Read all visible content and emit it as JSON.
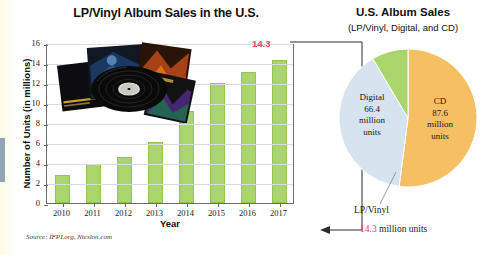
{
  "figure": {
    "source_note": "Source: IFPI.org, Nieslon.com"
  },
  "bar_chart": {
    "title": "LP/Vinyl Album Sales in the U.S.",
    "ylabel": "Number of Units (in millions)",
    "xlabel": "Year",
    "peak_label": "14.3"
  },
  "pie_chart": {
    "title": "U.S. Album Sales",
    "subtitle": "(LP/Vinyl, Digital, and CD)",
    "digital_label": "Digital",
    "digital_value": "66.4",
    "digital_unit1": "million",
    "digital_unit2": "units",
    "cd_label": "CD",
    "cd_value": "87.6",
    "cd_unit1": "million",
    "cd_unit2": "units",
    "lpvinyl_label": "LP/Vinyl",
    "lpvinyl_value": "14.3",
    "lpvinyl_value_suffix": " million units"
  },
  "colors": {
    "bar_green": "#a9d56c",
    "pie_digital": "#d6e4f0",
    "pie_cd": "#f5bf63",
    "pie_lpvinyl": "#a9d56c",
    "accent_red": "#d9475c"
  },
  "chart_data": [
    {
      "type": "bar",
      "title": "LP/Vinyl Album Sales in the U.S.",
      "xlabel": "Year",
      "ylabel": "Number of Units (in millions)",
      "categories": [
        "2010",
        "2011",
        "2012",
        "2013",
        "2014",
        "2015",
        "2016",
        "2017"
      ],
      "values": [
        2.8,
        3.9,
        4.6,
        6.1,
        9.2,
        12.0,
        13.1,
        14.3
      ],
      "ylim": [
        0,
        16
      ],
      "yticks": [
        0,
        2,
        4,
        6,
        8,
        10,
        12,
        14,
        16
      ],
      "grid": true,
      "legend": "none",
      "annotations": [
        "14.3"
      ]
    },
    {
      "type": "pie",
      "title": "U.S. Album Sales",
      "subtitle": "(LP/Vinyl, Digital, and CD)",
      "categories": [
        "CD",
        "Digital",
        "LP/Vinyl"
      ],
      "values": [
        87.6,
        66.4,
        14.3
      ],
      "unit": "million units",
      "legend": "labels-on-slices"
    }
  ]
}
